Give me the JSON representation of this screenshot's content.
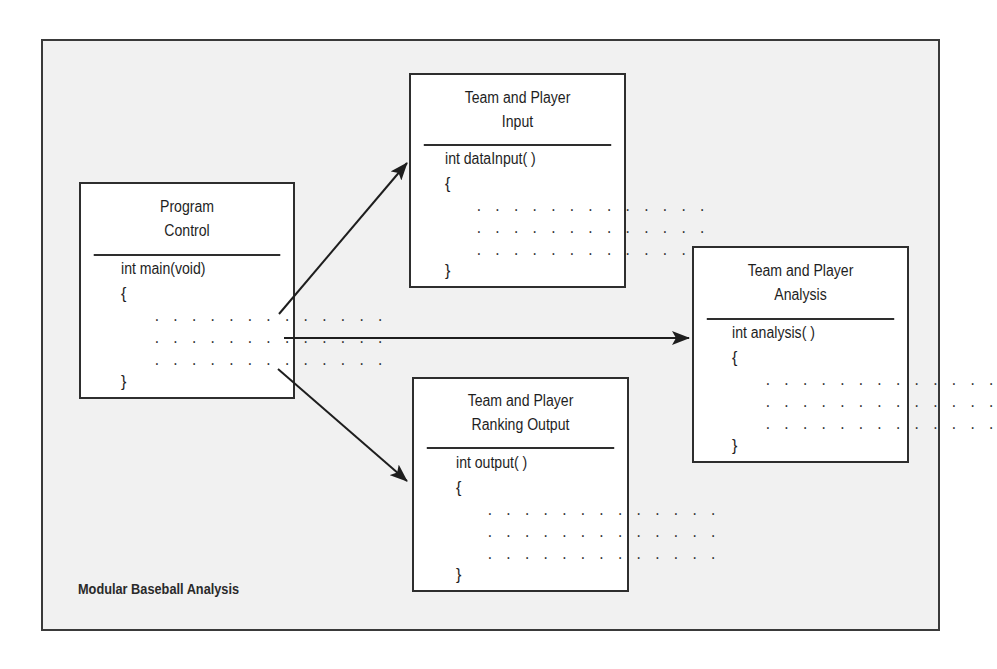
{
  "diagram": {
    "caption": "Modular Baseball Analysis",
    "modules": {
      "control": {
        "title_lines": [
          "Program",
          "Control"
        ],
        "signature": "int main(void)",
        "open_brace": "{",
        "close_brace": "}",
        "body_lines": [
          ". . . . . . . . . . . . .",
          ". . . . . . . . . . . . .",
          ". . . . . . . . . . . . ."
        ]
      },
      "input": {
        "title_lines": [
          "Team and Player",
          "Input"
        ],
        "signature": "int dataInput( )",
        "open_brace": "{",
        "close_brace": "}",
        "body_lines": [
          ". . . . . . . . . . . . .",
          ". . . . . . . . . . . . .",
          ". . . . . . . . . . . . ."
        ]
      },
      "analysis": {
        "title_lines": [
          "Team and Player",
          "Analysis"
        ],
        "signature": "int analysis( )",
        "open_brace": "{",
        "close_brace": "}",
        "body_lines": [
          ". . . . . . . . . . . . .",
          ". . . . . . . . . . . . .",
          ". . . . . . . . . . . . ."
        ]
      },
      "output": {
        "title_lines": [
          "Team and Player",
          "Ranking Output"
        ],
        "signature": "int output( )",
        "open_brace": "{",
        "close_brace": "}",
        "body_lines": [
          ". . . . . . . . . . . . .",
          ". . . . . . . . . . . . .",
          ". . . . . . . . . . . . ."
        ]
      }
    },
    "edges": [
      {
        "from": "Program Control",
        "to": "Team and Player Input"
      },
      {
        "from": "Program Control",
        "to": "Team and Player Analysis"
      },
      {
        "from": "Program Control",
        "to": "Team and Player Ranking Output"
      }
    ]
  }
}
